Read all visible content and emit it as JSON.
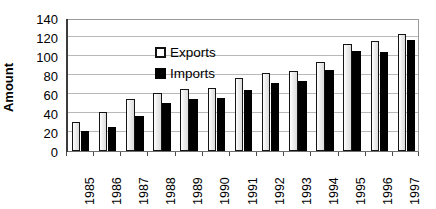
{
  "chart_data": {
    "type": "bar",
    "title": "",
    "subtitle": "",
    "xlabel": "",
    "ylabel": "Amount",
    "categories": [
      "1985",
      "1986",
      "1987",
      "1988",
      "1989",
      "1990",
      "1991",
      "1992",
      "1993",
      "1994",
      "1995",
      "1996",
      "1997"
    ],
    "series": [
      {
        "name": "Exports",
        "color": "#eeeeee",
        "values": [
          31,
          41,
          55,
          61,
          65,
          66,
          77,
          82,
          84,
          94,
          113,
          116,
          123
        ]
      },
      {
        "name": "Imports",
        "color": "#000000",
        "values": [
          21,
          25,
          37,
          51,
          55,
          56,
          64,
          72,
          74,
          85,
          105,
          104,
          117
        ]
      }
    ],
    "ylim": [
      0,
      140
    ],
    "ytick_step": 20,
    "yticks": [
      0,
      20,
      40,
      60,
      80,
      100,
      120,
      140
    ],
    "ytick_labels": [
      "0",
      "20",
      "40",
      "60",
      "80",
      "100",
      "120",
      "140"
    ],
    "grid": true,
    "grid_axis": "y",
    "legend_position": "upper-left-inside",
    "xtick_label_rotation": -90,
    "plot_background": "#ffffff",
    "grid_color": "#b8b8b8",
    "axis_color": "#3b3b3b"
  },
  "legend": {
    "items": [
      {
        "label": "Exports",
        "swatch": "square-outline-light"
      },
      {
        "label": "Imports",
        "swatch": "square-solid-black"
      }
    ]
  }
}
